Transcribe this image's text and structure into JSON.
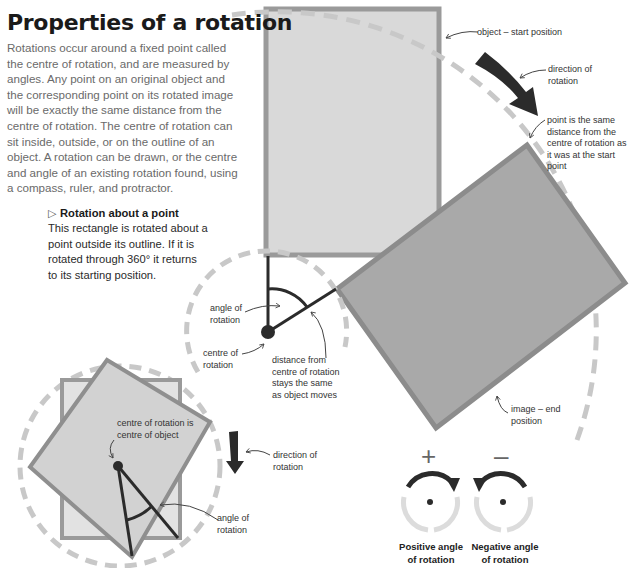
{
  "header": {
    "title": "Properties of a rotation",
    "intro": "Rotations occur around a fixed point called the centre of rotation, and are measured by angles. Any point on an original object and the corresponding point on its rotated image will be exactly the same distance from the centre of rotation. The centre of rotation can sit inside, outside, or on the outline of an object. A rotation can be drawn, or the centre and angle of an existing rotation found, using a compass, ruler, and protractor."
  },
  "caption": {
    "marker_icon": "triangle-right-outline",
    "heading": "Rotation about a point",
    "body": "This rectangle is rotated about a point outside its outline. If it is rotated through 360° it returns to its starting position."
  },
  "main_diagram": {
    "labels": {
      "object_start": "object – start position",
      "direction": "direction of rotation",
      "same_distance": "point is the same distance from the centre of rotation as it was at the start point",
      "angle": "angle of rotation",
      "centre": "centre of rotation",
      "distance": "distance from centre of rotation stays the same as object moves",
      "image_end": "image – end position"
    }
  },
  "inset_diagram": {
    "labels": {
      "centre_is_centre": "centre of rotation is centre of object",
      "direction": "direction of rotation",
      "angle": "angle of rotation"
    }
  },
  "sign_convention": {
    "positive": {
      "symbol": "+",
      "label": "Positive angle of rotation",
      "direction": "clockwise"
    },
    "negative": {
      "symbol": "–",
      "label": "Negative angle of rotation",
      "direction": "anticlockwise"
    }
  },
  "colors": {
    "start_fill": "#d9d9d9",
    "start_stroke": "#9a9a9a",
    "end_fill": "#a9a9a9",
    "end_stroke": "#8c8c8c",
    "dash": "#c8c8c8",
    "ink": "#2b2b2b"
  }
}
